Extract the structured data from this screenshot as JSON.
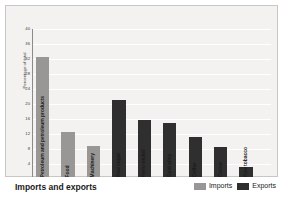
{
  "chart_data": {
    "type": "bar",
    "title": "Imports and exports",
    "xlabel": "",
    "ylabel": "Percentage of total",
    "ylim": [
      0,
      40
    ],
    "yticks": [
      40,
      36,
      32,
      28,
      24,
      20,
      16,
      12,
      8,
      4,
      0
    ],
    "grid": true,
    "legend_position": "bottom-right",
    "categories": [
      "Petroleum and petroleum products",
      "Food",
      "Machinery",
      "Raw sugar",
      "Ferro-nickel",
      "Gold alloy",
      "Coffee",
      "Cocoa",
      "Raw tobacco"
    ],
    "bars": [
      {
        "category": "Petroleum and petroleum products",
        "series": "Imports",
        "value": 32.5
      },
      {
        "category": "Food",
        "series": "Imports",
        "value": 12.5
      },
      {
        "category": "Machinery",
        "series": "Imports",
        "value": 8.8
      },
      {
        "category": "Raw sugar",
        "series": "Exports",
        "value": 21.0
      },
      {
        "category": "Ferro-nickel",
        "series": "Exports",
        "value": 15.8
      },
      {
        "category": "Gold alloy",
        "series": "Exports",
        "value": 15.0
      },
      {
        "category": "Coffee",
        "series": "Exports",
        "value": 11.2
      },
      {
        "category": "Cocoa",
        "series": "Exports",
        "value": 8.5
      },
      {
        "category": "Raw tobacco",
        "series": "Exports",
        "value": 3.2
      }
    ],
    "series": [
      {
        "name": "Imports",
        "color": "#989795"
      },
      {
        "name": "Exports",
        "color": "#2f2f2f"
      }
    ]
  },
  "legend": {
    "imports_label": "Imports",
    "exports_label": "Exports"
  },
  "footer": {
    "title": "Imports and exports"
  }
}
